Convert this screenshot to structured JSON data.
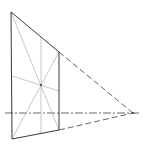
{
  "diagram": {
    "type": "perspective-construction",
    "points": {
      "top_left": [
        11,
        12
      ],
      "bottom_left": [
        12,
        139
      ],
      "vanishing_point": [
        133,
        113
      ],
      "right_top": [
        59,
        52
      ],
      "right_bottom": [
        59,
        130
      ],
      "mid_top": [
        41,
        37
      ],
      "mid_bottom": [
        41,
        134
      ],
      "center": [
        41,
        85
      ],
      "left_mid": [
        12,
        76
      ],
      "right_mid": [
        59,
        91
      ]
    },
    "horizon": {
      "y": 113,
      "x_start": 5,
      "x_end": 140
    },
    "colors": {
      "dark": "#3a3a3a",
      "light": "#b8b8b8",
      "dashed": "#555555",
      "background": "#ffffff"
    }
  }
}
